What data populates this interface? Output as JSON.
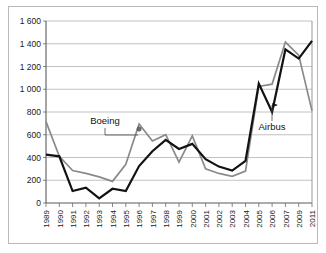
{
  "chart_data": {
    "type": "line",
    "title": "",
    "subtitle": "",
    "xlabel": "",
    "ylabel": "",
    "grid": "horizontal",
    "legend_position": "inline-annotations",
    "ylim": [
      0,
      1600
    ],
    "ytick_step": 200,
    "ytick_labels": [
      "0",
      "200",
      "400",
      "600",
      "800",
      "1 000",
      "1 200",
      "1 400",
      "1 600"
    ],
    "ytick_values": [
      0,
      200,
      400,
      600,
      800,
      1000,
      1200,
      1400,
      1600
    ],
    "categories": [
      "1989",
      "1990",
      "1991",
      "1992",
      "1993",
      "1994",
      "1995",
      "1996",
      "1997",
      "1998",
      "1999",
      "2000",
      "2001",
      "2002",
      "2003",
      "2004",
      "2005",
      "2006",
      "2007",
      "2009",
      "2011"
    ],
    "series": [
      {
        "name": "Boeing",
        "color": "#8a8a8a",
        "values": [
          715,
          410,
          285,
          260,
          230,
          190,
          340,
          695,
          545,
          600,
          360,
          590,
          300,
          260,
          235,
          280,
          1025,
          1045,
          1415,
          1300,
          810
        ]
      },
      {
        "name": "Airbus",
        "color": "#121212",
        "values": [
          425,
          410,
          105,
          135,
          40,
          125,
          105,
          325,
          455,
          555,
          475,
          520,
          385,
          320,
          285,
          370,
          1050,
          800,
          1350,
          1270,
          1425
        ]
      }
    ],
    "annotations": [
      {
        "label": "Boeing",
        "series": "Boeing",
        "points_to_category": "1996",
        "points_to_value": 650,
        "marker": "dot"
      },
      {
        "label": "Airbus",
        "series": "Airbus",
        "points_to_category": "2006",
        "points_to_value": 870,
        "marker": "arrow"
      }
    ]
  },
  "frame": {
    "border_color": "#b9b9b9"
  }
}
